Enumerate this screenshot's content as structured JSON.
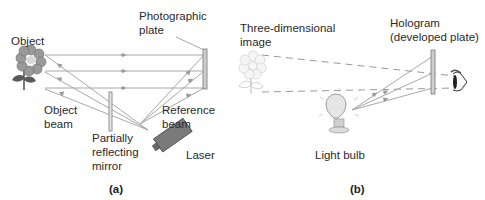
{
  "panel_a": {
    "caption": "(a)",
    "labels": {
      "object": "Object",
      "photographic_plate_1": "Photographic",
      "photographic_plate_2": "plate",
      "object_beam_1": "Object",
      "object_beam_2": "beam",
      "reference_beam_1": "Reference",
      "reference_beam_2": "beam",
      "mirror_1": "Partially",
      "mirror_2": "reflecting",
      "mirror_3": "mirror",
      "laser": "Laser"
    }
  },
  "panel_b": {
    "caption": "(b)",
    "labels": {
      "image_1": "Three-dimensional",
      "image_2": "image",
      "hologram_1": "Hologram",
      "hologram_2": "(developed plate)",
      "light_bulb": "Light bulb"
    }
  },
  "colors": {
    "ray": "#a8a8a8",
    "flower_petal": "#9a9a9a",
    "flower_leaf": "#5a5a5a",
    "laser_body": "#7a7a7a",
    "plate": "#cfcfcf"
  }
}
